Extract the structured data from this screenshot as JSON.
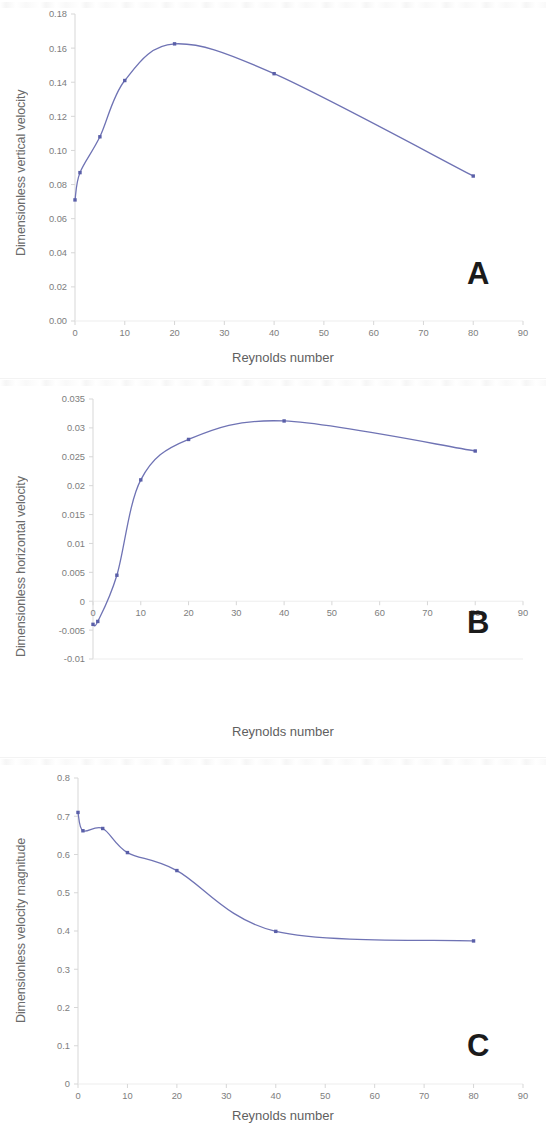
{
  "figure": {
    "panel_count": 3,
    "line_color": "#6f73b4",
    "marker_color": "#5a5fa8",
    "axis_color": "#d7d7d7",
    "tick_color": "#7d7d7d"
  },
  "panels": [
    {
      "letter": "A",
      "ylabel": "Dimensionless vertical velocity",
      "xlabel": "Reynolds number",
      "yticks": [
        "0.00",
        "0.02",
        "0.04",
        "0.06",
        "0.08",
        "0.10",
        "0.12",
        "0.14",
        "0.16",
        "0.18"
      ],
      "xticks": [
        "0",
        "10",
        "20",
        "30",
        "40",
        "50",
        "60",
        "70",
        "80",
        "90"
      ]
    },
    {
      "letter": "B",
      "ylabel": "Dimensionless horizontal velocity",
      "xlabel": "Reynolds number",
      "yticks": [
        "-0.01",
        "-0.005",
        "0",
        "0.005",
        "0.01",
        "0.015",
        "0.02",
        "0.025",
        "0.03",
        "0.035"
      ],
      "xticks": [
        "0",
        "10",
        "20",
        "30",
        "40",
        "50",
        "60",
        "70",
        "80",
        "90"
      ]
    },
    {
      "letter": "C",
      "ylabel": "Dimensionless velocity magnitude",
      "xlabel": "Reynolds number",
      "yticks": [
        "0",
        "0.1",
        "0.2",
        "0.3",
        "0.4",
        "0.5",
        "0.6",
        "0.7",
        "0.8"
      ],
      "xticks": [
        "0",
        "10",
        "20",
        "30",
        "40",
        "50",
        "60",
        "70",
        "80",
        "90"
      ]
    }
  ],
  "chart_data": [
    {
      "type": "line",
      "panel": "A",
      "title": "",
      "xlabel": "Reynolds number",
      "ylabel": "Dimensionless vertical velocity",
      "xlim": [
        0,
        90
      ],
      "ylim": [
        0.0,
        0.18
      ],
      "yticks": [
        0,
        0.02,
        0.04,
        0.06,
        0.08,
        0.1,
        0.12,
        0.14,
        0.16,
        0.18
      ],
      "xticks": [
        0,
        10,
        20,
        30,
        40,
        50,
        60,
        70,
        80,
        90
      ],
      "grid": false,
      "legend": "none",
      "x": [
        0,
        1,
        5,
        10,
        20,
        40,
        80
      ],
      "values": [
        0.071,
        0.087,
        0.108,
        0.141,
        0.1625,
        0.145,
        0.085
      ],
      "markers": true,
      "smoothing": "spline"
    },
    {
      "type": "line",
      "panel": "B",
      "title": "",
      "xlabel": "Reynolds number",
      "ylabel": "Dimensionless horizontal velocity",
      "xlim": [
        0,
        90
      ],
      "ylim": [
        -0.01,
        0.035
      ],
      "yticks": [
        -0.01,
        -0.005,
        0,
        0.005,
        0.01,
        0.015,
        0.02,
        0.025,
        0.03,
        0.035
      ],
      "xticks": [
        0,
        10,
        20,
        30,
        40,
        50,
        60,
        70,
        80,
        90
      ],
      "grid": false,
      "legend": "none",
      "x": [
        0,
        1,
        5,
        10,
        20,
        40,
        80
      ],
      "values": [
        -0.004,
        -0.0035,
        0.0045,
        0.021,
        0.028,
        0.0312,
        0.026
      ],
      "markers": true,
      "smoothing": "spline"
    },
    {
      "type": "line",
      "panel": "C",
      "title": "",
      "xlabel": "Reynolds number",
      "ylabel": "Dimensionless velocity magnitude",
      "xlim": [
        0,
        90
      ],
      "ylim": [
        0,
        0.8
      ],
      "yticks": [
        0,
        0.1,
        0.2,
        0.3,
        0.4,
        0.5,
        0.6,
        0.7,
        0.8
      ],
      "xticks": [
        0,
        10,
        20,
        30,
        40,
        50,
        60,
        70,
        80,
        90
      ],
      "grid": false,
      "legend": "none",
      "x": [
        0,
        1,
        5,
        10,
        20,
        40,
        80
      ],
      "values": [
        0.71,
        0.662,
        0.668,
        0.605,
        0.558,
        0.399,
        0.374
      ],
      "markers": true,
      "smoothing": "spline"
    }
  ]
}
